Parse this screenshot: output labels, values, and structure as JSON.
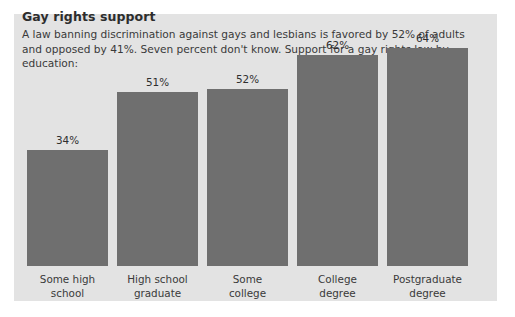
{
  "chart_data": {
    "type": "bar",
    "title": "Gay rights support",
    "subtitle": "A law banning discrimination against gays and lesbians is favored by 52% of adults and opposed by 41%. Seven percent don't know. Support for a gay rights law by education:",
    "categories": [
      "Some high school",
      "High school graduate",
      "Some college",
      "College degree",
      "Postgraduate degree"
    ],
    "category_lines": [
      [
        "Some high",
        "school"
      ],
      [
        "High school",
        "graduate"
      ],
      [
        "Some",
        "college"
      ],
      [
        "College",
        "degree"
      ],
      [
        "Postgraduate",
        "degree"
      ]
    ],
    "values": [
      34,
      51,
      52,
      62,
      64
    ],
    "value_labels": [
      "34%",
      "51%",
      "52%",
      "62%",
      "64%"
    ],
    "xlabel": "",
    "ylabel": "",
    "ylim": [
      0,
      74
    ],
    "grid": false,
    "legend": "none",
    "units": "percent",
    "colors": {
      "bar": "#6f6f6f",
      "panel_background": "#e3e3e3",
      "page_background": "#ffffff",
      "title_text": "#2d2d2d",
      "body_text": "#3a3a3a"
    }
  }
}
